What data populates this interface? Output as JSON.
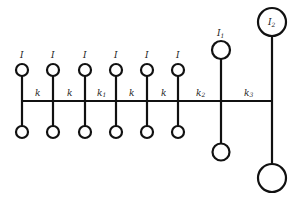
{
  "diagram": {
    "colors": {
      "stroke": "#111111",
      "label": "#222222",
      "background": "#ffffff"
    },
    "shaft_y": 101,
    "small_disks": [
      {
        "x": 22,
        "label": "I"
      },
      {
        "x": 53,
        "label": "I"
      },
      {
        "x": 85,
        "label": "I"
      },
      {
        "x": 116,
        "label": "I"
      },
      {
        "x": 147,
        "label": "I"
      },
      {
        "x": 178,
        "label": "I"
      }
    ],
    "springs": [
      {
        "label": "k",
        "sub": ""
      },
      {
        "label": "k",
        "sub": ""
      },
      {
        "label": "k",
        "sub": "1"
      },
      {
        "label": "k",
        "sub": ""
      },
      {
        "label": "k",
        "sub": ""
      },
      {
        "label": "k",
        "sub": "2"
      },
      {
        "label": "k",
        "sub": "3"
      }
    ],
    "large_disks": [
      {
        "x": 221,
        "label": "I",
        "sub": "1"
      },
      {
        "x": 272,
        "label": "I",
        "sub": "2"
      }
    ]
  }
}
